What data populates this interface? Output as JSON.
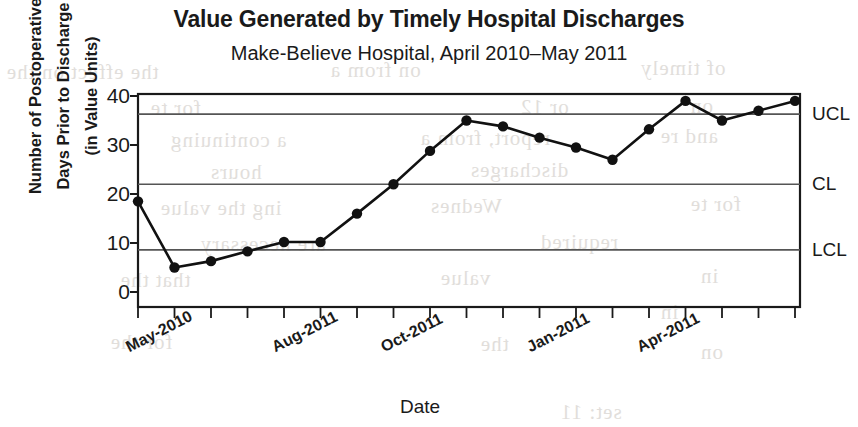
{
  "title": "Value Generated by Timely Hospital Discharges",
  "subtitle": "Make-Believe Hospital, April 2010–May 2011",
  "axis": {
    "y_title_line1": "Number of Postoperative",
    "y_title_line2": "Days Prior to Discharge",
    "y_title_line3": "(in Value Units)",
    "x_title": "Date"
  },
  "limits": {
    "ucl_label": "UCL",
    "cl_label": "CL",
    "lcl_label": "LCL",
    "ucl_value": 36.3,
    "cl_value": 22.0,
    "lcl_value": 8.6
  },
  "ghost_text": [
    {
      "x": 6,
      "y": 60,
      "text": "the effect on the"
    },
    {
      "x": 330,
      "y": 58,
      "text": "on from a"
    },
    {
      "x": 640,
      "y": 56,
      "text": "of timely"
    },
    {
      "x": 150,
      "y": 96,
      "text": "for te"
    },
    {
      "x": 520,
      "y": 95,
      "text": "or 12"
    },
    {
      "x": 690,
      "y": 94,
      "text": "on"
    },
    {
      "x": 170,
      "y": 128,
      "text": "a continuing"
    },
    {
      "x": 420,
      "y": 126,
      "text": "report, from a"
    },
    {
      "x": 660,
      "y": 124,
      "text": "and re"
    },
    {
      "x": 210,
      "y": 160,
      "text": "hours"
    },
    {
      "x": 470,
      "y": 158,
      "text": "discharges"
    },
    {
      "x": 160,
      "y": 196,
      "text": "ing the value"
    },
    {
      "x": 430,
      "y": 194,
      "text": "Wednes"
    },
    {
      "x": 690,
      "y": 192,
      "text": "for te"
    },
    {
      "x": 200,
      "y": 232,
      "text": "are necessary"
    },
    {
      "x": 540,
      "y": 230,
      "text": "required"
    },
    {
      "x": 120,
      "y": 268,
      "text": "that the"
    },
    {
      "x": 440,
      "y": 266,
      "text": "value"
    },
    {
      "x": 700,
      "y": 264,
      "text": "in"
    },
    {
      "x": 660,
      "y": 300,
      "text": "in"
    },
    {
      "x": 110,
      "y": 330,
      "text": "for the"
    },
    {
      "x": 480,
      "y": 332,
      "text": "the"
    },
    {
      "x": 700,
      "y": 340,
      "text": "on"
    },
    {
      "x": 560,
      "y": 400,
      "text": "set: 11"
    }
  ],
  "chart_data": {
    "type": "line",
    "title": "Value Generated by Timely Hospital Discharges",
    "subtitle": "Make-Believe Hospital, April 2010–May 2011",
    "xlabel": "Date",
    "ylabel": "Number of Postoperative Days Prior to Discharge (in Value Units)",
    "ylim": [
      0,
      42
    ],
    "yticks": [
      0,
      10,
      20,
      30,
      40
    ],
    "grid": true,
    "legend": "none",
    "x_tick_labels": [
      {
        "label": "May-2010",
        "index": 1
      },
      {
        "label": "Aug-2011",
        "index": 5
      },
      {
        "label": "Oct-2011",
        "index": 8
      },
      {
        "label": "Jan-2011",
        "index": 12
      },
      {
        "label": "Apr-2011",
        "index": 15
      }
    ],
    "n_points": 18,
    "values": [
      18.5,
      5.0,
      6.3,
      8.3,
      10.2,
      10.2,
      16.0,
      22.0,
      28.8,
      35.0,
      33.8,
      31.5,
      29.5,
      27.0,
      33.2,
      39.0,
      35.0,
      37.0,
      39.0
    ],
    "reference_lines": [
      {
        "name": "UCL",
        "value": 36.3
      },
      {
        "name": "CL",
        "value": 22.0
      },
      {
        "name": "LCL",
        "value": 8.6
      }
    ]
  }
}
